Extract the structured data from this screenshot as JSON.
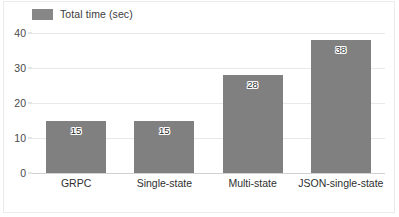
{
  "chart_data": {
    "type": "bar",
    "title": "",
    "xlabel": "",
    "ylabel": "",
    "categories": [
      "GRPC",
      "Single-state",
      "Multi-state",
      "JSON-single-state"
    ],
    "values": [
      15,
      15,
      28,
      38
    ],
    "series": [
      {
        "name": "Total time (sec)",
        "values": [
          15,
          15,
          28,
          38
        ]
      }
    ],
    "legend": {
      "position": "top-left",
      "entries": [
        {
          "label": "Total time (sec)",
          "color": "#808080"
        }
      ]
    },
    "ylim": [
      0,
      40
    ],
    "yticks": [
      0,
      10,
      20,
      30,
      40
    ],
    "ytick_labels": [
      "0",
      "10",
      "20",
      "30",
      "40"
    ],
    "grid": true,
    "grid_axis": "y",
    "data_labels": [
      "15",
      "15",
      "28",
      "38"
    ],
    "colors": {
      "bar": "#808080",
      "gridline": "#e9e7e7",
      "baseline": "#d2d0d0",
      "text": "#2f2f2f",
      "frame": "#eceaea"
    }
  }
}
